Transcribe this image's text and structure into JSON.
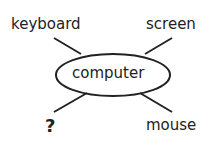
{
  "diagram": {
    "center": {
      "label": "computer"
    },
    "nodes": [
      {
        "id": "top-left",
        "label": "keyboard"
      },
      {
        "id": "top-right",
        "label": "screen"
      },
      {
        "id": "bottom-left",
        "label": "?"
      },
      {
        "id": "bottom-right",
        "label": "mouse"
      }
    ],
    "colors": {
      "ink": "#222222",
      "background": "#ffffff"
    }
  }
}
